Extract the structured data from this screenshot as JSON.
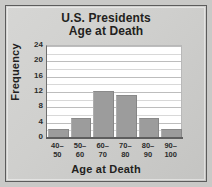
{
  "chart_data": {
    "type": "bar",
    "title": "U.S. Presidents Age at Death",
    "title_lines": [
      "U.S. Presidents",
      "Age at Death"
    ],
    "xlabel": "Age at Death",
    "ylabel": "Frequency",
    "categories": [
      "40-50",
      "50-60",
      "60-70",
      "70-80",
      "80-90",
      "90-100"
    ],
    "category_lines": [
      [
        "40–",
        "50"
      ],
      [
        "50–",
        "60"
      ],
      [
        "60–",
        "70"
      ],
      [
        "70–",
        "80"
      ],
      [
        "80–",
        "90"
      ],
      [
        "90–",
        "100"
      ]
    ],
    "values": [
      2,
      5,
      12,
      11,
      5,
      2
    ],
    "ylim": [
      0,
      24
    ],
    "ytick_labels": [
      "0",
      "4",
      "8",
      "12",
      "16",
      "20",
      "24"
    ],
    "ytick_values": [
      0,
      4,
      8,
      12,
      16,
      20,
      24
    ],
    "minor_gridline_values": [
      2,
      6,
      10,
      14,
      18,
      22
    ],
    "grid": "horizontal",
    "legend": "none",
    "bar_color": "#9c9c9c",
    "plot_background": "#ffffff",
    "figure_background": "#cfcfcd",
    "text_color": "#231f20"
  }
}
